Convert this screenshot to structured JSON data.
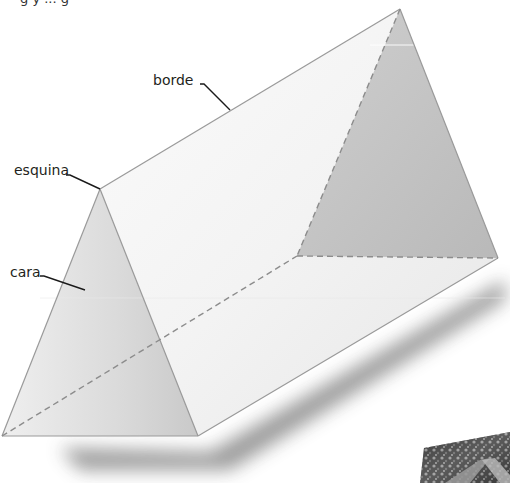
{
  "figure": {
    "caption_partial": "g y ... g",
    "labels": {
      "edge": "borde",
      "vertex": "esquina",
      "face": "cara"
    },
    "colors": {
      "background": "#ffffff",
      "face_front": "#d9d9d9",
      "face_side": "#f2f2f2",
      "face_back": "#bdbdbd",
      "edge_line": "#9a9a9a",
      "hidden_edge": "#8c8c8c",
      "leader_line": "#1a1a1a",
      "shadow": "#555555"
    },
    "inset_photo": {
      "description": "grayscale photo of a tent-shaped roof among trees",
      "position": "bottom-right corner, partially visible"
    }
  }
}
